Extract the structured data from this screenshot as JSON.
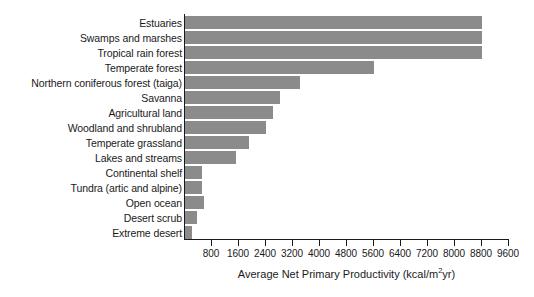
{
  "chart_data": {
    "type": "bar",
    "orientation": "horizontal",
    "title": "",
    "xlabel": "Average Net Primary Productivity (kcal/m²yr)",
    "ylabel": "",
    "xlim": [
      0,
      9600
    ],
    "ylim": null,
    "grid": false,
    "legend": null,
    "bar_color": "#8b8b8b",
    "axis_color": "#1a1a1a",
    "background_color": "#ffffff",
    "xticks": [
      800,
      1600,
      2400,
      3200,
      4000,
      4800,
      5600,
      6400,
      7200,
      8000,
      8800,
      9600
    ],
    "xtick_labels": [
      "800",
      "1600",
      "2400",
      "3200",
      "4000",
      "4800",
      "5600",
      "6400",
      "7200",
      "8000",
      "8800",
      "9600"
    ],
    "categories": [
      "Estuaries",
      "Swamps and marshes",
      "Tropical rain forest",
      "Temperate forest",
      "Northern coniferous forest (taiga)",
      "Savanna",
      "Agricultural land",
      "Woodland and shrubland",
      "Temperate grassland",
      "Lakes and streams",
      "Continental shelf",
      "Tundra (artic and alpine)",
      "Open ocean",
      "Desert scrub",
      "Extreme desert"
    ],
    "values": [
      8800,
      8800,
      8800,
      5600,
      3400,
      2800,
      2600,
      2400,
      1900,
      1500,
      500,
      500,
      550,
      350,
      200
    ]
  },
  "axis_title_parts": {
    "prefix": "Average Net Primary Productivity (kcal/m",
    "superscript": "2",
    "suffix": "yr)"
  }
}
